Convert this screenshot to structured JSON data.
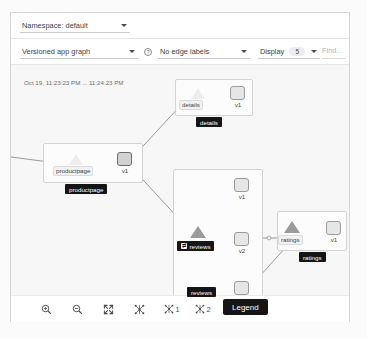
{
  "toolbar_namespace": {
    "namespace_label": "Namespace: default",
    "caret_icon": "chevron-down-icon"
  },
  "toolbar_controls": {
    "graph_type_label": "Versioned app graph",
    "help_icon": "question-circle-icon",
    "help_glyph": "?",
    "edge_labels_label": "No edge labels",
    "display_label": "Display",
    "display_value": "5",
    "find_placeholder": "Find..."
  },
  "graph": {
    "timestamp": "Oct 19, 11:23:23 PM ... 11:24:23 PM",
    "groups": [
      {
        "name": "productpage",
        "badge": "productpage",
        "service_label": "productpage",
        "versions": [
          "v1"
        ]
      },
      {
        "name": "details",
        "badge": "details",
        "service_label": "details",
        "versions": [
          "v1"
        ]
      },
      {
        "name": "reviews",
        "badge": "reviews",
        "service_label": "reviews",
        "versions": [
          "v1",
          "v2",
          "v3"
        ],
        "badge_icon": "traffic-shift-icon",
        "badge_icon_glyph": "⇄"
      },
      {
        "name": "ratings",
        "badge": "ratings",
        "service_label": "ratings",
        "versions": [
          "v1"
        ]
      }
    ],
    "floating_badge": "reviews"
  },
  "bottom_toolbar": {
    "zoom_in": {
      "name": "zoom-in",
      "glyph": "⊕"
    },
    "zoom_out": {
      "name": "zoom-out",
      "glyph": "⊖"
    },
    "fit": {
      "name": "fit-to-screen",
      "glyph": "⤢"
    },
    "layout_default": {
      "name": "layout-default",
      "glyph": "✳"
    },
    "layout_one": {
      "name": "layout-1",
      "glyph": "✳",
      "suffix": "1"
    },
    "layout_two": {
      "name": "layout-2",
      "glyph": "✳",
      "suffix": "2"
    },
    "legend_label": "Legend"
  },
  "colors": {
    "badge_bg": "#151515",
    "node_fill": "#e6e6e6",
    "node_stroke": "#9b9b9b",
    "edge": "#9a9a9a",
    "canvas_bg": "#f7f7f7"
  }
}
